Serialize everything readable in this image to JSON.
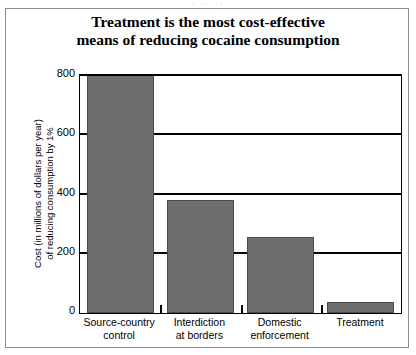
{
  "figure": {
    "title_lines": [
      "Treatment is the most cost-effective",
      "means of reducing cocaine consumption"
    ],
    "y_axis_title_lines": [
      "Cost (in millions of dollars per year)",
      "of reducing consumption by 1%"
    ],
    "scan_top_sliver": "· ·· ··",
    "colors": {
      "bar_fill": "#6e6e6e",
      "bar_edge": "#4a4a4a",
      "axis": "#000000",
      "frame": "#8c8c8c",
      "background": "#ffffff"
    }
  },
  "chart_data": {
    "type": "bar",
    "title": "Treatment is the most cost-effective means of reducing cocaine consumption",
    "xlabel": "",
    "ylabel": "Cost (in millions of dollars per year) of reducing consumption by 1%",
    "categories": [
      "Source-country control",
      "Interdiction at borders",
      "Domestic enforcement",
      "Treatment"
    ],
    "category_lines": [
      [
        "Source-country",
        "control"
      ],
      [
        "Interdiction",
        "at borders"
      ],
      [
        "Domestic",
        "enforcement"
      ],
      [
        "Treatment"
      ]
    ],
    "values": [
      800,
      380,
      255,
      37
    ],
    "value_notes": [
      "bar is clipped at the top of the plot area (>= 800)",
      "",
      "",
      ""
    ],
    "ylim": [
      0,
      800
    ],
    "yticks": [
      0,
      200,
      400,
      600,
      800
    ],
    "ytick_labels": [
      "0",
      "200",
      "400",
      "600",
      "800"
    ],
    "grid": "horizontal",
    "legend": "none",
    "series": [
      {
        "name": "Cost per 1% reduction",
        "values": [
          800,
          380,
          255,
          37
        ]
      }
    ]
  }
}
